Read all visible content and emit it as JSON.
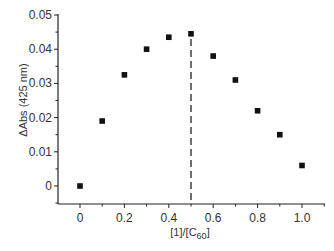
{
  "chart_data": {
    "type": "scatter",
    "title": "",
    "xlabel": "[1]/[C60]",
    "ylabel": "ΔAbs (425 nm)",
    "xlim": [
      -0.1,
      1.1
    ],
    "ylim": [
      -0.005,
      0.05
    ],
    "x_ticks": [
      "0",
      "0.2",
      "0.4",
      "0.6",
      "0.8",
      "1.0"
    ],
    "y_ticks": [
      "0",
      "0.01",
      "0.02",
      "0.03",
      "0.04",
      "0.05"
    ],
    "grid": false,
    "legend": null,
    "series": [
      {
        "name": "ΔAbs",
        "marker": "filled-square",
        "x": [
          0,
          0.1,
          0.2,
          0.3,
          0.4,
          0.5,
          0.6,
          0.7,
          0.8,
          0.9,
          1.0
        ],
        "y": [
          0,
          0.019,
          0.0325,
          0.04,
          0.0435,
          0.0445,
          0.038,
          0.031,
          0.022,
          0.015,
          0.006
        ]
      }
    ],
    "annotations": [
      {
        "type": "vertical-dashed-line",
        "x": 0.5,
        "from_y": -0.005,
        "to_y": 0.0445
      }
    ]
  },
  "labels": {
    "xlabel_main": "[1]/[C",
    "xlabel_sub": "60",
    "xlabel_end": "]",
    "ylabel": "ΔAbs (425 nm)"
  }
}
